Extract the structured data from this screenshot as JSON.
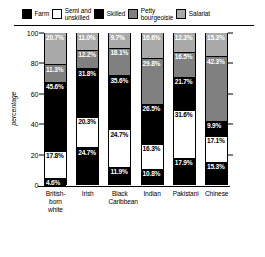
{
  "chart": {
    "type": "bar",
    "ylabel": "percentage"
  },
  "legend": {
    "position": "top",
    "items": [
      {
        "label": "Farm",
        "color": "#000000"
      },
      {
        "label": "Semi and\nunskilled",
        "color": "#ffffff"
      },
      {
        "label": "Skilled",
        "color": "#000000"
      },
      {
        "label": "Petty\nbourgeoisie",
        "color": "#808080"
      },
      {
        "label": "Salariat",
        "color": "#a9a9a9"
      }
    ]
  },
  "yaxis": {
    "ticks": [
      "100",
      "80",
      "60",
      "40",
      "20",
      "0"
    ],
    "values": [
      100,
      80,
      60,
      40,
      20,
      0
    ]
  },
  "xaxis": {
    "labels": [
      "British-\nborn white",
      "Irish",
      "Black\nCaribbean",
      "Indian",
      "Pakistani",
      "Chinese"
    ]
  },
  "chart_data": {
    "type": "bar",
    "stacked": true,
    "normalized": true,
    "title": "",
    "xlabel": "",
    "ylabel": "percentage",
    "ylim": [
      0,
      100
    ],
    "grid": false,
    "legend_position": "top",
    "categories": [
      "British-born white",
      "Irish",
      "Black Caribbean",
      "Indian",
      "Pakistani",
      "Chinese"
    ],
    "series": [
      {
        "name": "Farm",
        "color": "#000000",
        "values": [
          4.6,
          24.7,
          11.9,
          10.8,
          17.9,
          15.3
        ]
      },
      {
        "name": "Semi and unskilled",
        "color": "#ffffff",
        "values": [
          17.8,
          20.3,
          24.7,
          16.3,
          31.6,
          17.1
        ]
      },
      {
        "name": "Skilled",
        "color": "#000000",
        "values": [
          45.6,
          31.8,
          35.6,
          26.5,
          21.7,
          9.9
        ]
      },
      {
        "name": "Petty bourgeoisie",
        "color": "#808080",
        "values": [
          11.3,
          12.2,
          18.1,
          29.8,
          16.5,
          42.3
        ]
      },
      {
        "name": "Salariat",
        "color": "#a9a9a9",
        "values": [
          20.7,
          11.0,
          9.7,
          16.6,
          12.3,
          15.3
        ]
      }
    ],
    "bars": [
      {
        "category": "British-born white",
        "segments": [
          {
            "series": "Salariat",
            "value": 20.7,
            "label": "20.7%",
            "fill": "#a9a9a9"
          },
          {
            "series": "Petty bourgeoisie",
            "value": 11.3,
            "label": "11.3%",
            "fill": "#808080"
          },
          {
            "series": "Skilled",
            "value": 45.6,
            "label": "45.6%",
            "fill": "#000000"
          },
          {
            "series": "Semi and unskilled",
            "value": 17.8,
            "label": "17.8%",
            "fill": "#ffffff"
          },
          {
            "series": "Farm",
            "value": 4.6,
            "label": "4.6%",
            "fill": "#000000"
          }
        ]
      },
      {
        "category": "Irish",
        "segments": [
          {
            "series": "Salariat",
            "value": 11.0,
            "label": "11.0%",
            "fill": "#a9a9a9"
          },
          {
            "series": "Petty bourgeoisie",
            "value": 12.2,
            "label": "12.2%",
            "fill": "#808080"
          },
          {
            "series": "Skilled",
            "value": 31.8,
            "label": "31.8%",
            "fill": "#000000"
          },
          {
            "series": "Semi and unskilled",
            "value": 20.3,
            "label": "20.3%",
            "fill": "#ffffff"
          },
          {
            "series": "Farm",
            "value": 24.7,
            "label": "24.7%",
            "fill": "#000000"
          }
        ]
      },
      {
        "category": "Black Caribbean",
        "segments": [
          {
            "series": "Salariat",
            "value": 9.7,
            "label": "9.7%",
            "fill": "#a9a9a9"
          },
          {
            "series": "Petty bourgeoisie",
            "value": 18.1,
            "label": "18.1%",
            "fill": "#808080"
          },
          {
            "series": "Skilled",
            "value": 35.6,
            "label": "35.6%",
            "fill": "#000000"
          },
          {
            "series": "Semi and unskilled",
            "value": 24.7,
            "label": "24.7%",
            "fill": "#ffffff"
          },
          {
            "series": "Farm",
            "value": 11.9,
            "label": "11.9%",
            "fill": "#000000"
          }
        ]
      },
      {
        "category": "Indian",
        "segments": [
          {
            "series": "Salariat",
            "value": 16.6,
            "label": "16.6%",
            "fill": "#a9a9a9"
          },
          {
            "series": "Petty bourgeoisie",
            "value": 29.8,
            "label": "29.8%",
            "fill": "#808080"
          },
          {
            "series": "Skilled",
            "value": 26.5,
            "label": "26.5%",
            "fill": "#000000"
          },
          {
            "series": "Semi and unskilled",
            "value": 16.3,
            "label": "16.3%",
            "fill": "#ffffff"
          },
          {
            "series": "Farm",
            "value": 10.8,
            "label": "10.8%",
            "fill": "#000000"
          }
        ]
      },
      {
        "category": "Pakistani",
        "segments": [
          {
            "series": "Salariat",
            "value": 12.3,
            "label": "12.3%",
            "fill": "#a9a9a9"
          },
          {
            "series": "Petty bourgeoisie",
            "value": 16.5,
            "label": "16.5%",
            "fill": "#808080"
          },
          {
            "series": "Skilled",
            "value": 21.7,
            "label": "21.7%",
            "fill": "#000000"
          },
          {
            "series": "Semi and unskilled",
            "value": 31.6,
            "label": "31.6%",
            "fill": "#ffffff"
          },
          {
            "series": "Farm",
            "value": 17.9,
            "label": "17.9%",
            "fill": "#000000"
          }
        ]
      },
      {
        "category": "Chinese",
        "segments": [
          {
            "series": "Salariat",
            "value": 15.3,
            "label": "15.3%",
            "fill": "#a9a9a9"
          },
          {
            "series": "Petty bourgeoisie",
            "value": 42.3,
            "label": "42.3%",
            "fill": "#808080"
          },
          {
            "series": "Skilled",
            "value": 9.9,
            "label": "9.9%",
            "fill": "#000000"
          },
          {
            "series": "Semi and unskilled",
            "value": 17.1,
            "label": "17.1%",
            "fill": "#ffffff"
          },
          {
            "series": "Farm",
            "value": 15.3,
            "label": "15.3%",
            "fill": "#000000"
          }
        ]
      }
    ]
  }
}
